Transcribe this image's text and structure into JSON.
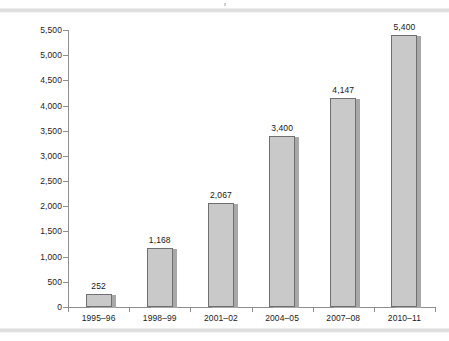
{
  "chart_data": {
    "type": "bar",
    "title": "",
    "xlabel": "",
    "ylabel": "",
    "categories": [
      "1995–96",
      "1998–99",
      "2001–02",
      "2004–05",
      "2007–08",
      "2010–11"
    ],
    "values": [
      252,
      1168,
      2067,
      3400,
      4147,
      5400
    ],
    "value_labels": [
      "252",
      "1,168",
      "2,067",
      "3,400",
      "4,147",
      "5,400"
    ],
    "ylim": [
      0,
      5500
    ],
    "ytick_step": 500,
    "ytick_labels": [
      "0",
      "500",
      "1,000",
      "1,500",
      "2,000",
      "2,500",
      "3,000",
      "3,500",
      "4,000",
      "4,500",
      "5,000",
      "5,500"
    ],
    "ytick_values": [
      0,
      500,
      1000,
      1500,
      2000,
      2500,
      3000,
      3500,
      4000,
      4500,
      5000,
      5500
    ],
    "grid": false,
    "legend": false,
    "legend_position": "none",
    "bar_fill_color": "#c9c9c9",
    "bar_border_color": "#6f6f6f",
    "axis_color": "#8e8e8e",
    "text_color": "#1b1b1b",
    "background_color": "#ffffff"
  }
}
